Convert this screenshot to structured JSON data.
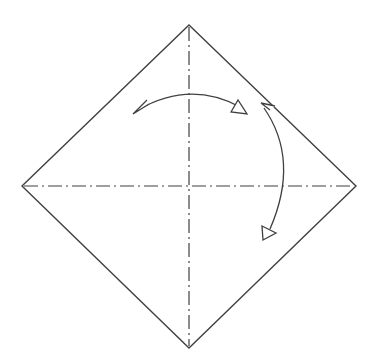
{
  "diagram": {
    "type": "origami-step",
    "colors": {
      "background": "#ffffff",
      "paper_fill": "#ffffff",
      "line": "#404040"
    },
    "paper": {
      "top": [
        189,
        25
      ],
      "right": [
        356,
        186
      ],
      "bottom": [
        189,
        348
      ],
      "left": [
        22,
        186
      ]
    },
    "creases": [
      {
        "name": "vertical-crease",
        "style": "dash-dot",
        "from": [
          189,
          25
        ],
        "to": [
          189,
          348
        ]
      },
      {
        "name": "horizontal-crease",
        "style": "dash-dot",
        "from": [
          22,
          186
        ],
        "to": [
          356,
          186
        ]
      }
    ],
    "arrows": [
      {
        "name": "top-arrow",
        "type": "two-headed-curved",
        "from": [
          135,
          113
        ],
        "to": [
          243,
          110
        ]
      },
      {
        "name": "right-arrow",
        "type": "two-headed-curved",
        "from": [
          262,
          102
        ],
        "to": [
          268,
          236
        ]
      }
    ]
  }
}
